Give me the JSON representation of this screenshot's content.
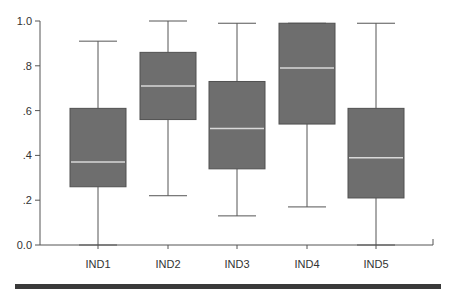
{
  "chart_data": {
    "type": "boxplot",
    "title": "",
    "xlabel": "",
    "ylabel": "",
    "ylim": [
      0.0,
      1.0
    ],
    "yticks": [
      {
        "value": 0.0,
        "label": "0.0"
      },
      {
        "value": 0.2,
        "label": ".2"
      },
      {
        "value": 0.4,
        "label": ".4"
      },
      {
        "value": 0.6,
        "label": ".6"
      },
      {
        "value": 0.8,
        "label": ".8"
      },
      {
        "value": 1.0,
        "label": "1.0"
      }
    ],
    "grid": false,
    "legend": null,
    "categories": [
      "IND1",
      "IND2",
      "IND3",
      "IND4",
      "IND5"
    ],
    "boxes": [
      {
        "name": "IND1",
        "min": 0.0,
        "q1": 0.26,
        "median": 0.37,
        "q3": 0.61,
        "max": 0.91
      },
      {
        "name": "IND2",
        "min": 0.22,
        "q1": 0.56,
        "median": 0.71,
        "q3": 0.86,
        "max": 1.0
      },
      {
        "name": "IND3",
        "min": 0.13,
        "q1": 0.34,
        "median": 0.52,
        "q3": 0.73,
        "max": 0.99
      },
      {
        "name": "IND4",
        "min": 0.17,
        "q1": 0.54,
        "median": 0.79,
        "q3": 0.99,
        "max": 0.99
      },
      {
        "name": "IND5",
        "min": 0.0,
        "q1": 0.21,
        "median": 0.39,
        "q3": 0.61,
        "max": 0.99
      }
    ],
    "colors": {
      "box_fill": "#6e6e6e",
      "box_stroke": "#505050",
      "median_line": "#d9d9d9",
      "whisker": "#555555",
      "axis": "#555555"
    }
  }
}
